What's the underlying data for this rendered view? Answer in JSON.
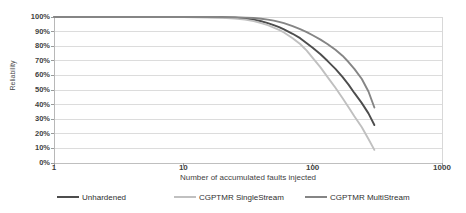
{
  "chart_data": {
    "type": "line",
    "title": "",
    "xlabel": "Number of accumulated faults injected",
    "ylabel": "Reliability",
    "xscale": "log",
    "xlim": [
      1,
      1000
    ],
    "ylim": [
      0,
      1
    ],
    "grid": true,
    "legend_position": "bottom",
    "xticks": [
      "1",
      "10",
      "100",
      "1000"
    ],
    "xtick_values": [
      1,
      10,
      100,
      1000
    ],
    "yticks": [
      "0%",
      "10%",
      "20%",
      "30%",
      "40%",
      "50%",
      "60%",
      "70%",
      "80%",
      "90%",
      "100%"
    ],
    "ytick_values": [
      0,
      0.1,
      0.2,
      0.3,
      0.4,
      0.5,
      0.6,
      0.7,
      0.8,
      0.9,
      1.0
    ],
    "series": [
      {
        "name": "Unhardened",
        "color": "#4d4d4d",
        "x": [
          1,
          5,
          10,
          15,
          20,
          25,
          30,
          35,
          40,
          45,
          50,
          55,
          60,
          70,
          80,
          90,
          100,
          115,
          130,
          150,
          170,
          190,
          210,
          240,
          270,
          300
        ],
        "y": [
          1.0,
          1.0,
          1.0,
          0.999,
          0.998,
          0.995,
          0.99,
          0.982,
          0.971,
          0.958,
          0.944,
          0.93,
          0.915,
          0.885,
          0.855,
          0.82,
          0.79,
          0.745,
          0.7,
          0.645,
          0.59,
          0.535,
          0.48,
          0.41,
          0.34,
          0.26
        ]
      },
      {
        "name": "CGPTMR SingleStream",
        "color": "#c0c0c0",
        "x": [
          1,
          5,
          10,
          15,
          20,
          25,
          30,
          35,
          40,
          45,
          50,
          55,
          60,
          70,
          80,
          90,
          100,
          115,
          130,
          150,
          170,
          190,
          210,
          240,
          270,
          300
        ],
        "y": [
          1.0,
          1.0,
          0.999,
          0.997,
          0.994,
          0.989,
          0.982,
          0.972,
          0.958,
          0.944,
          0.928,
          0.912,
          0.894,
          0.855,
          0.815,
          0.77,
          0.72,
          0.655,
          0.59,
          0.515,
          0.445,
          0.38,
          0.32,
          0.245,
          0.165,
          0.09
        ]
      },
      {
        "name": "CGPTMR MultiStream",
        "color": "#858585",
        "x": [
          1,
          5,
          10,
          15,
          20,
          25,
          30,
          35,
          40,
          45,
          50,
          55,
          60,
          70,
          80,
          90,
          100,
          115,
          130,
          150,
          170,
          190,
          210,
          240,
          270,
          300
        ],
        "y": [
          1.0,
          1.0,
          1.0,
          1.0,
          0.999,
          0.998,
          0.996,
          0.993,
          0.988,
          0.982,
          0.975,
          0.967,
          0.958,
          0.938,
          0.917,
          0.897,
          0.875,
          0.845,
          0.815,
          0.775,
          0.735,
          0.69,
          0.645,
          0.575,
          0.49,
          0.38
        ]
      }
    ]
  },
  "legend": {
    "items": [
      {
        "label": "Unhardened"
      },
      {
        "label": "CGPTMR SingleStream"
      },
      {
        "label": "CGPTMR MultiStream"
      }
    ]
  }
}
